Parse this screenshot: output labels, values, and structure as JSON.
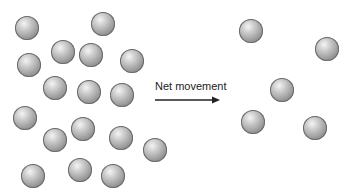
{
  "diagram": {
    "label": "Net movement",
    "arrow_direction": "right",
    "sphere_diameter": 24,
    "left_region": {
      "description": "high concentration",
      "spheres": [
        [
          27,
          28
        ],
        [
          103,
          24
        ],
        [
          63,
          52
        ],
        [
          91,
          55
        ],
        [
          29,
          65
        ],
        [
          132,
          61
        ],
        [
          55,
          88
        ],
        [
          89,
          92
        ],
        [
          122,
          95
        ],
        [
          25,
          118
        ],
        [
          83,
          129
        ],
        [
          55,
          140
        ],
        [
          121,
          138
        ],
        [
          155,
          150
        ],
        [
          33,
          176
        ],
        [
          80,
          170
        ],
        [
          113,
          176
        ]
      ]
    },
    "right_region": {
      "description": "low concentration",
      "spheres": [
        [
          251,
          31
        ],
        [
          327,
          49
        ],
        [
          282,
          90
        ],
        [
          253,
          122
        ],
        [
          315,
          128
        ]
      ]
    }
  }
}
